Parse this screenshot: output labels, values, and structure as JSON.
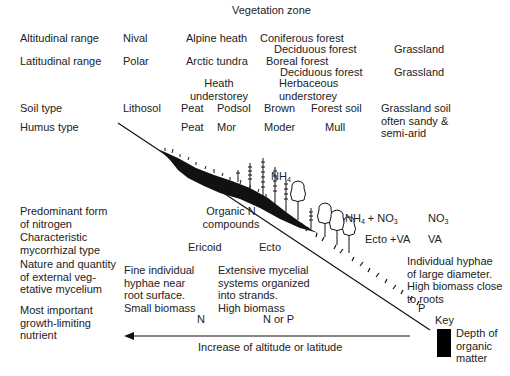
{
  "title": "Vegetation zone",
  "rows": {
    "altitudinal": {
      "label": "Altitudinal range",
      "values": [
        "Nival",
        "Alpine heath",
        "Coniferous forest",
        "Deciduous forest",
        "Grassland"
      ]
    },
    "latitudinal": {
      "label": "Latitudinal range",
      "values": [
        "Polar",
        "Arctic tundra",
        "Boreal forest",
        "Deciduous forest",
        "Grassland"
      ]
    },
    "understorey": {
      "values": [
        "Heath\nunderstorey",
        "Herbaceous\nunderstorey"
      ]
    },
    "soil": {
      "label": "Soil type",
      "values": [
        "Lithosol",
        "Peat",
        "Podsol",
        "Brown",
        "Forest soil",
        "Grassland soil\noften sandy &\nsemi-arid"
      ]
    },
    "humus": {
      "label": "Humus type",
      "values": [
        "Peat",
        "Mor",
        "Moder",
        "Mull"
      ]
    },
    "nitrogen": {
      "label": "Predominant form\nof nitrogen",
      "values": [
        "Organic N\ncompounds",
        "NH4",
        "NH4 + NO3",
        "NO3"
      ]
    },
    "mycorrhizal": {
      "label": "Characteristic\nmycorrhizal type",
      "values": [
        "Ericoid",
        "Ecto",
        "Ecto +VA",
        "VA"
      ]
    },
    "mycelium": {
      "label": "Nature and quantity\nof external veg-\netative mycelium",
      "values": [
        "Fine individual\nhyphae near\nroot surface.\nSmall biomass",
        "Extensive mycelial\nsystems organized\ninto strands.\nHigh biomass",
        "Individual hyphae\nof large diameter.\nHigh biomass close\nto roots"
      ]
    },
    "limiting": {
      "label": "Most important\ngrowth-limiting\nnutrient",
      "values": [
        "N",
        "N or P",
        "P"
      ]
    }
  },
  "arrow": {
    "label": "Increase of altitude or latitude",
    "direction": "left"
  },
  "key": {
    "title": "Key",
    "swatch_color": "#000000",
    "label": "Depth of\norganic\nmatter"
  },
  "colors": {
    "ink": "#222222",
    "background": "#ffffff"
  }
}
